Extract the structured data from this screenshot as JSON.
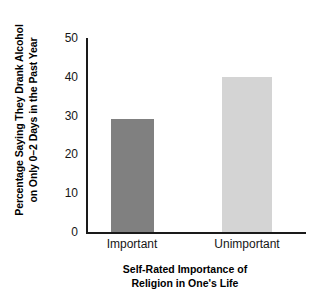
{
  "chart_data": {
    "type": "bar",
    "title": "",
    "categories": [
      "Important",
      "Unimportant"
    ],
    "values": [
      29,
      40
    ],
    "series": [
      {
        "name": "Percentage Saying They Drank Alcohol on Only 0–2 Days in the Past Year",
        "values": [
          29,
          40
        ]
      }
    ],
    "xlabel": "Self-Rated Importance of Religion in One's Life",
    "xlabel_lines": [
      "Self-Rated Importance of",
      "Religion in One's Life"
    ],
    "ylabel": "Percentage Saying They Drank Alcohol on Only 0–2 Days in the Past Year",
    "ylabel_lines": [
      "Percentage Saying They Drank Alcohol",
      "on Only 0–2 Days in the Past Year"
    ],
    "ylim": [
      0,
      50
    ],
    "yticks": [
      0,
      10,
      20,
      30,
      40,
      50
    ],
    "ytick_labels": [
      "0",
      "10",
      "20",
      "30",
      "40",
      "50"
    ],
    "grid": false,
    "legend": "none",
    "bar_colors": [
      "#808080",
      "#d4d4d4"
    ],
    "axis_color": "#1a1a1a",
    "background": "#ffffff"
  }
}
